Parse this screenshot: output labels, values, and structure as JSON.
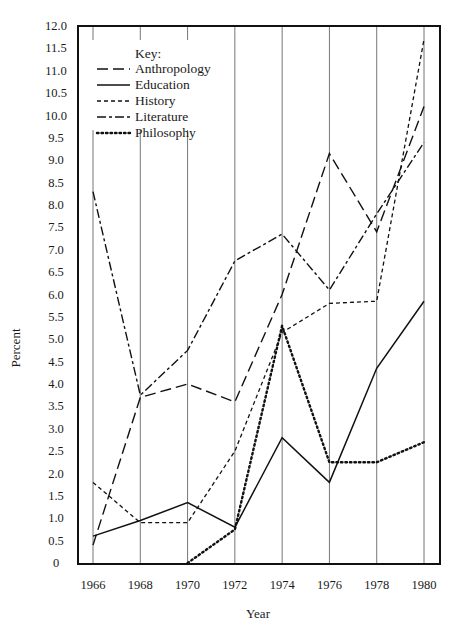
{
  "chart_data": {
    "type": "line",
    "title": "",
    "xlabel": "Year",
    "ylabel": "Percent",
    "x": [
      1966,
      1968,
      1970,
      1972,
      1974,
      1976,
      1978,
      1980
    ],
    "x_tick_labels": [
      "1966",
      "1968",
      "1970",
      "1972",
      "1974",
      "1976",
      "1978",
      "1980"
    ],
    "y_tick_labels": [
      "0",
      "0.5",
      "1.0",
      "1.5",
      "2.0",
      "2.5",
      "3.0",
      "3.5",
      "4.0",
      "4.5",
      "5.0",
      "5.5",
      "6.0",
      "6.5",
      "7.0",
      "7.5",
      "8.0",
      "8.5",
      "9.0",
      "9.5",
      "10.0",
      "10.5",
      "11.0",
      "11.5",
      "12.0"
    ],
    "ylim": [
      0,
      12
    ],
    "xlim": [
      1965,
      1981.3
    ],
    "grid": "vertical lines at each labeled year",
    "legend_title": "Key:",
    "legend_placement": "top-left",
    "series": [
      {
        "name": "Anthropology",
        "style": "long-dash",
        "values": [
          0.4,
          3.7,
          4.0,
          3.6,
          6.0,
          9.15,
          7.4,
          10.2
        ]
      },
      {
        "name": "Education",
        "style": "solid",
        "values": [
          0.6,
          0.95,
          1.35,
          0.8,
          2.8,
          1.8,
          4.35,
          5.85
        ]
      },
      {
        "name": "History",
        "style": "short-dash",
        "values": [
          1.8,
          0.9,
          0.9,
          2.5,
          5.15,
          5.8,
          5.85,
          11.7
        ]
      },
      {
        "name": "Literature",
        "style": "dash-dot",
        "values": [
          8.3,
          3.75,
          4.75,
          6.75,
          7.35,
          6.1,
          7.8,
          9.4
        ]
      },
      {
        "name": "Philosophy",
        "style": "dotted",
        "values": [
          null,
          null,
          0.0,
          0.75,
          5.3,
          2.25,
          2.25,
          2.7
        ]
      }
    ]
  }
}
